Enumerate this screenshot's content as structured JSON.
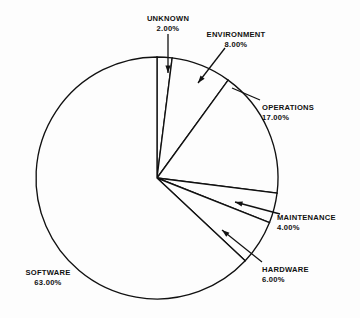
{
  "chart_data": {
    "type": "pie",
    "title": "",
    "subtitle": "",
    "xlabel": "",
    "ylabel": "",
    "legend_position": "none",
    "grid": false,
    "units": "percent",
    "start_angle_deg": 0,
    "direction": "clockwise",
    "categories": [
      "UNKNOWN",
      "ENVIRONMENT",
      "OPERATIONS",
      "MAINTENANCE",
      "HARDWARE",
      "SOFTWARE"
    ],
    "values": [
      2.0,
      8.0,
      17.0,
      4.0,
      6.0,
      63.0
    ],
    "slices": [
      {
        "label": "UNKNOWN",
        "value": 2.0,
        "value_text": "2.00%",
        "start_deg": 0.0,
        "end_deg": 7.2,
        "label_x": 168,
        "label_y": 14,
        "label_align": "center",
        "leader": {
          "type": "arrow",
          "x1": 168,
          "y1": 34,
          "x2": 168,
          "y2": 73
        }
      },
      {
        "label": "ENVIRONMENT",
        "value": 8.0,
        "value_text": "8.00%",
        "start_deg": 7.2,
        "end_deg": 36.0,
        "label_x": 236,
        "label_y": 30,
        "label_align": "center",
        "leader": {
          "type": "arrow",
          "x1": 225,
          "y1": 48,
          "x2": 198,
          "y2": 83
        }
      },
      {
        "label": "OPERATIONS",
        "value": 17.0,
        "value_text": "17.00%",
        "start_deg": 36.0,
        "end_deg": 97.2,
        "label_x": 262,
        "label_y": 103,
        "label_align": "left",
        "leader": {
          "type": "line",
          "x1": 260,
          "y1": 100,
          "x2": 232,
          "y2": 88
        }
      },
      {
        "label": "MAINTENANCE",
        "value": 4.0,
        "value_text": "4.00%",
        "start_deg": 97.2,
        "end_deg": 111.6,
        "label_x": 277,
        "label_y": 213,
        "label_align": "left",
        "leader": {
          "type": "arrow",
          "x1": 280,
          "y1": 214,
          "x2": 235,
          "y2": 202
        }
      },
      {
        "label": "HARDWARE",
        "value": 6.0,
        "value_text": "6.00%",
        "start_deg": 111.6,
        "end_deg": 133.2,
        "label_x": 262,
        "label_y": 265,
        "label_align": "left",
        "leader": {
          "type": "arrow",
          "x1": 262,
          "y1": 262,
          "x2": 222,
          "y2": 230
        }
      },
      {
        "label": "SOFTWARE",
        "value": 63.0,
        "value_text": "63.00%",
        "start_deg": 133.2,
        "end_deg": 360.0,
        "label_x": 48,
        "label_y": 268,
        "label_align": "center",
        "leader": null
      }
    ],
    "geometry": {
      "center_x": 157,
      "center_y": 178,
      "radius": 121
    },
    "colors": {
      "slice_fill": "#fdfdfd",
      "outline": "#111111",
      "text": "#111111",
      "background": "#fdfdfd"
    }
  }
}
